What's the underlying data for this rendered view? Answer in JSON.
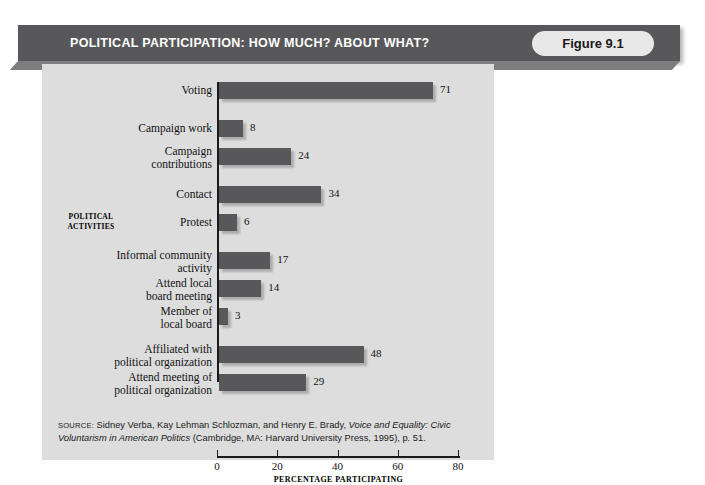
{
  "header": {
    "title": "POLITICAL PARTICIPATION: HOW MUCH? ABOUT WHAT?",
    "figure_badge": "Figure 9.1",
    "bar_color": "#58585a",
    "title_color": "#ffffff"
  },
  "chart_data": {
    "type": "bar",
    "orientation": "horizontal",
    "title": "POLITICAL PARTICIPATION: HOW MUCH? ABOUT WHAT?",
    "xlabel": "PERCENTAGE PARTICIPATING",
    "ylabel": "POLITICAL ACTIVITIES",
    "xlim": [
      0,
      80
    ],
    "xticks": [
      0,
      20,
      40,
      60,
      80
    ],
    "xtick_labels": [
      "0",
      "20",
      "40",
      "60",
      "80"
    ],
    "grid": false,
    "legend": "none",
    "bar_color": "#58585a",
    "plot_background": "#dddddd",
    "categories": [
      "Voting",
      "Campaign work",
      "Campaign contributions",
      "Contact",
      "Protest",
      "Informal community activity",
      "Attend local board meeting",
      "Member of local board",
      "Affiliated with political organization",
      "Attend meeting of political organization"
    ],
    "values": [
      71,
      8,
      24,
      34,
      6,
      17,
      14,
      3,
      48,
      29
    ],
    "bars": [
      {
        "label_lines": [
          "Voting"
        ],
        "value": 71,
        "top": 10
      },
      {
        "label_lines": [
          "Campaign work"
        ],
        "value": 8,
        "top": 48
      },
      {
        "label_lines": [
          "Campaign",
          "contributions"
        ],
        "value": 24,
        "top": 76
      },
      {
        "label_lines": [
          "Contact"
        ],
        "value": 34,
        "top": 114
      },
      {
        "label_lines": [
          "Protest"
        ],
        "value": 6,
        "top": 142
      },
      {
        "label_lines": [
          "Informal community",
          "activity"
        ],
        "value": 17,
        "top": 180
      },
      {
        "label_lines": [
          "Attend local",
          "board meeting"
        ],
        "value": 14,
        "top": 208
      },
      {
        "label_lines": [
          "Member of",
          "local board"
        ],
        "value": 3,
        "top": 236
      },
      {
        "label_lines": [
          "Affiliated with",
          "political organization"
        ],
        "value": 48,
        "top": 274
      },
      {
        "label_lines": [
          "Attend meeting of",
          "political organization"
        ],
        "value": 29,
        "top": 302
      }
    ]
  },
  "source": {
    "label": "SOURCE:",
    "text_before_italic": " Sidney Verba, Kay Lehman Schlozman, and Henry E. Brady, ",
    "italic_title": "Voice and Equality: Civic Voluntarism in American Politics",
    "text_after_italic": " (Cambridge, MA: Harvard University Press, 1995), p. 51."
  }
}
